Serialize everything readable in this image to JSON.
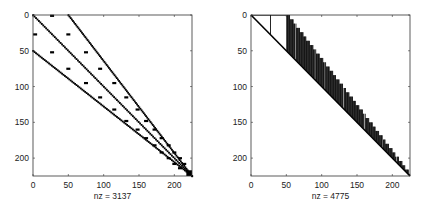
{
  "chart_data": [
    {
      "type": "heatmap",
      "subtype": "sparsity-pattern",
      "title": "",
      "xlabel": "nz = 3137",
      "ylabel": "",
      "nz": 3137,
      "matrix_size": 225,
      "xlim": [
        0,
        225
      ],
      "ylim": [
        225,
        0
      ],
      "xticks": [
        0,
        50,
        100,
        150,
        200
      ],
      "yticks": [
        0,
        50,
        100,
        150,
        200
      ],
      "xtick_labels": [
        "0",
        "50",
        "100",
        "150",
        "200"
      ],
      "ytick_labels": [
        "0",
        "50",
        "100",
        "150",
        "200"
      ],
      "marker_color": "#000000",
      "pattern": {
        "bands": [
          {
            "name": "main-diagonal",
            "from": [
              0,
              0
            ],
            "to": [
              225,
              225
            ]
          },
          {
            "name": "upper-band",
            "from_col_row": [
              50,
              0
            ],
            "to_col_row": [
              225,
              225
            ]
          },
          {
            "name": "lower-band",
            "from_col_row": [
              0,
              50
            ],
            "to_col_row": [
              225,
              225
            ]
          }
        ],
        "scattered_entries_col_row": [
          [
            27,
            1
          ],
          [
            3,
            27
          ],
          [
            50,
            27
          ],
          [
            27,
            52
          ],
          [
            75,
            52
          ],
          [
            50,
            75
          ],
          [
            95,
            75
          ],
          [
            75,
            95
          ],
          [
            115,
            95
          ],
          [
            95,
            115
          ],
          [
            132,
            115
          ],
          [
            115,
            132
          ],
          [
            148,
            132
          ],
          [
            132,
            148
          ],
          [
            160,
            148
          ],
          [
            148,
            160
          ],
          [
            172,
            160
          ],
          [
            160,
            172
          ],
          [
            182,
            172
          ],
          [
            172,
            182
          ],
          [
            192,
            182
          ],
          [
            182,
            192
          ],
          [
            200,
            192
          ],
          [
            192,
            200
          ],
          [
            208,
            200
          ],
          [
            200,
            208
          ],
          [
            214,
            208
          ],
          [
            208,
            214
          ]
        ]
      }
    },
    {
      "type": "heatmap",
      "subtype": "sparsity-pattern",
      "title": "",
      "xlabel": "nz = 4775",
      "ylabel": "",
      "nz": 4775,
      "matrix_size": 225,
      "xlim": [
        0,
        225
      ],
      "ylim": [
        225,
        0
      ],
      "xticks": [
        0,
        50,
        100,
        150,
        200
      ],
      "yticks": [
        0,
        50,
        100,
        150,
        200
      ],
      "xtick_labels": [
        "0",
        "50",
        "100",
        "150",
        "200"
      ],
      "ytick_labels": [
        "0",
        "50",
        "100",
        "150",
        "200"
      ],
      "marker_color": "#000000",
      "pattern": {
        "structure": "upper-triangular envelope (factor)",
        "diagonal": {
          "from": [
            0,
            0
          ],
          "to": [
            225,
            225
          ]
        },
        "column_spikes_col_rowrange": [
          [
            27,
            0,
            27
          ]
        ],
        "profile_top_edge_col_row": [
          [
            50,
            0
          ],
          [
            225,
            225
          ]
        ],
        "gap_columns": [
          62,
          90,
          104,
          130,
          160,
          186,
          205
        ]
      }
    }
  ]
}
